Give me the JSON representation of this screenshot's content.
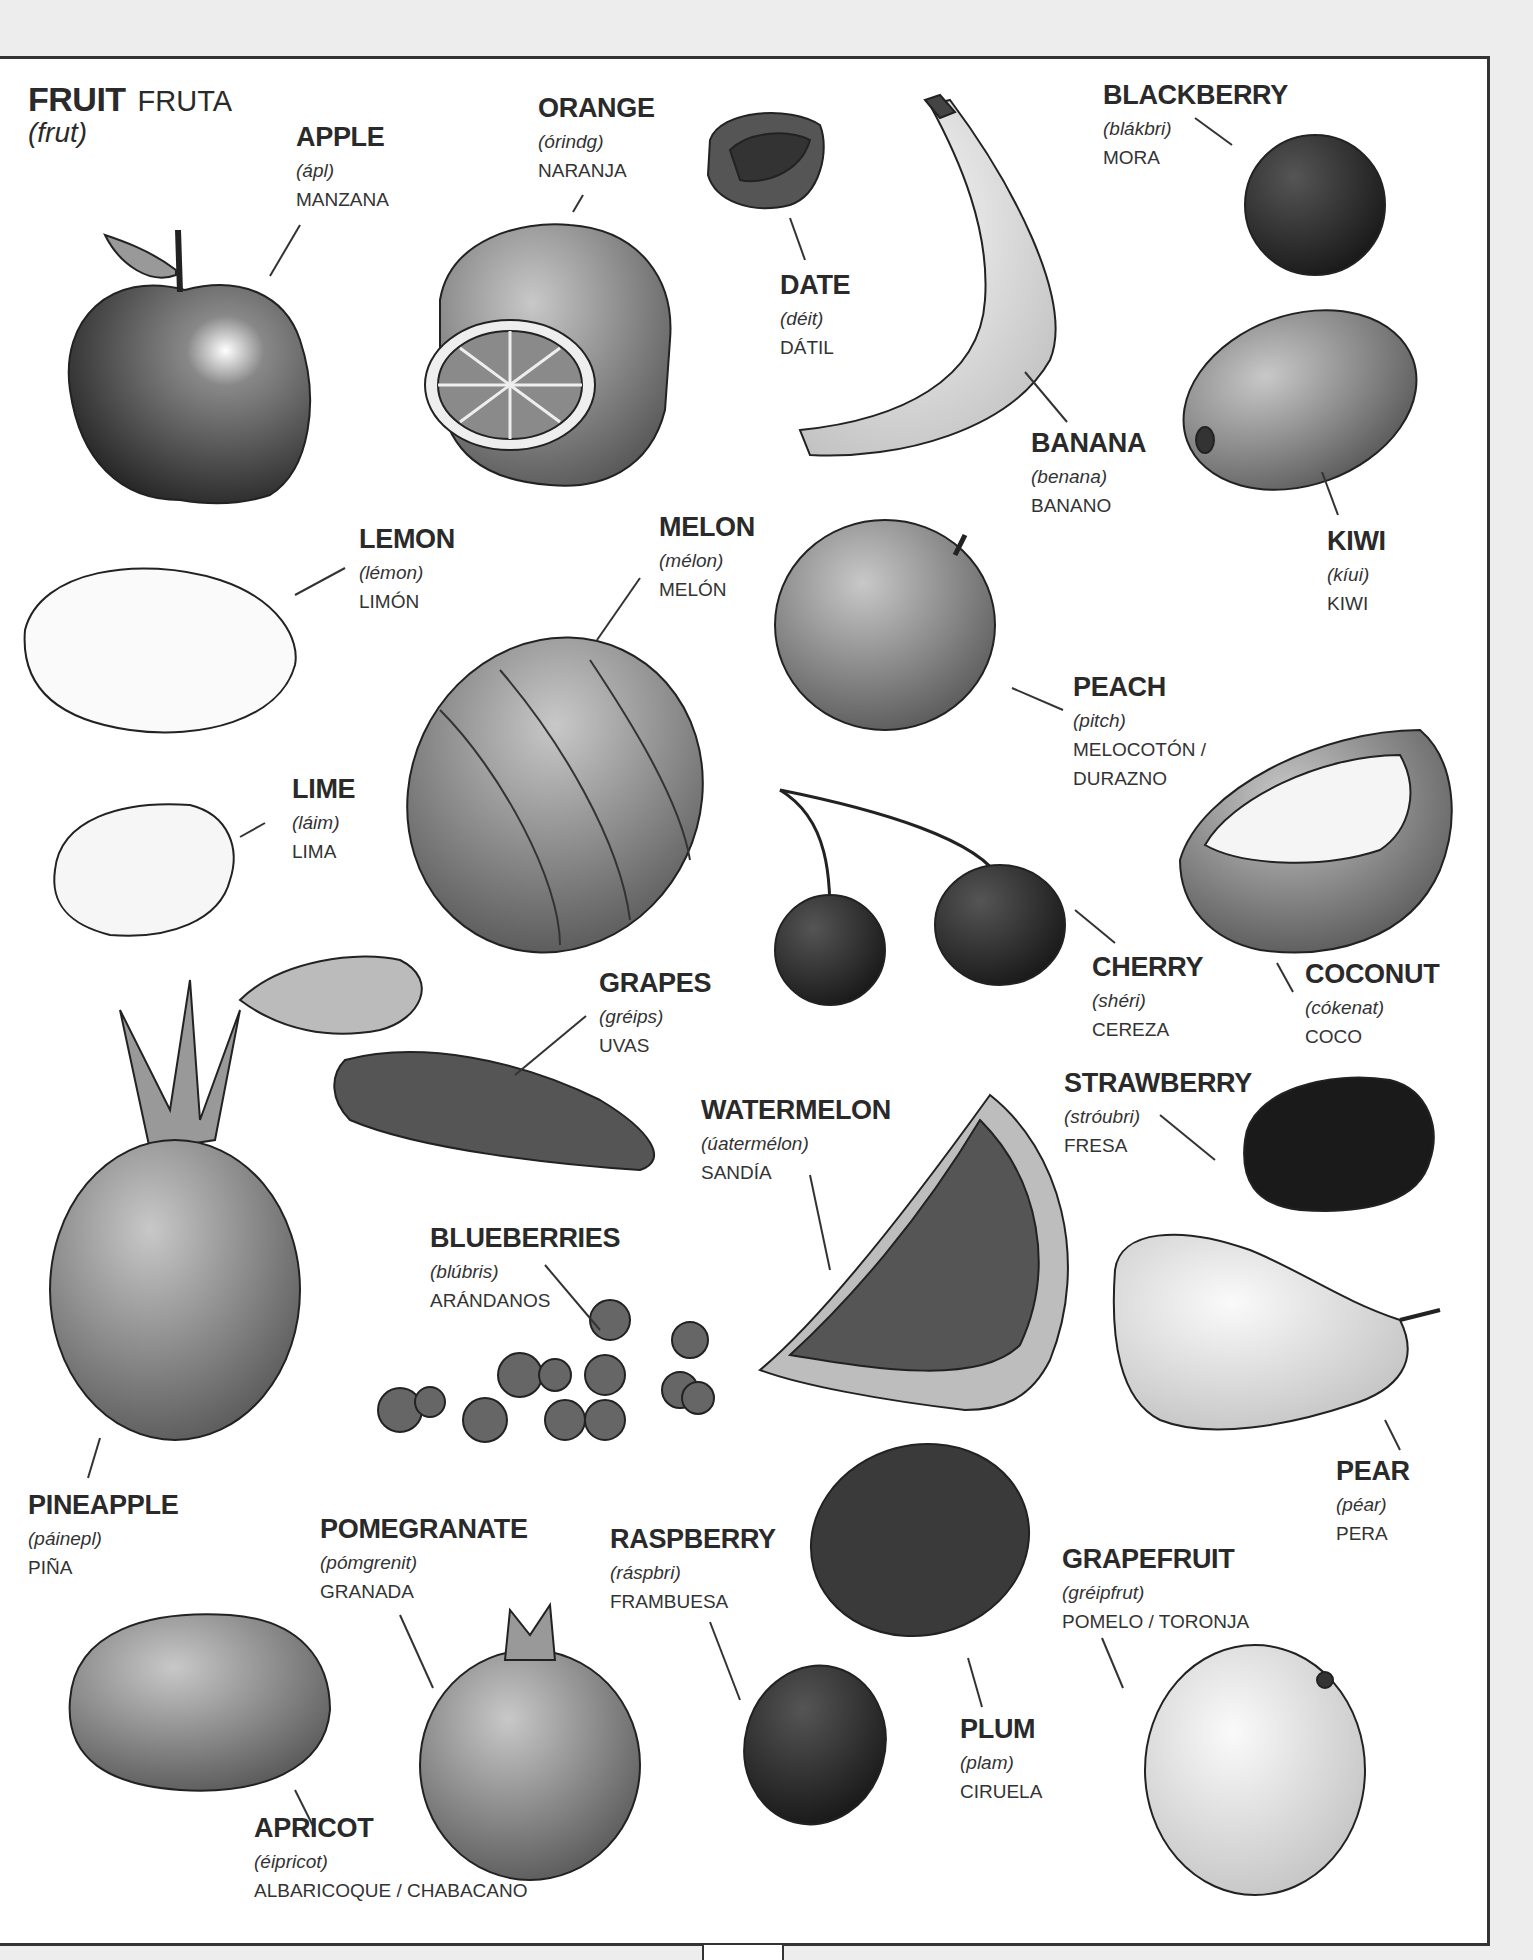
{
  "title": {
    "english": "FRUIT",
    "spanish": "FRUTA",
    "pronunciation": "(frut)"
  },
  "fruits": [
    {
      "id": "apple",
      "english": "APPLE",
      "pronunciation": "(ápl)",
      "spanish": "MANZANA"
    },
    {
      "id": "orange",
      "english": "ORANGE",
      "pronunciation": "(órindg)",
      "spanish": "NARANJA"
    },
    {
      "id": "date",
      "english": "DATE",
      "pronunciation": "(déit)",
      "spanish": "DÁTIL"
    },
    {
      "id": "banana",
      "english": "BANANA",
      "pronunciation": "(benana)",
      "spanish": "BANANO"
    },
    {
      "id": "blackberry",
      "english": "BLACKBERRY",
      "pronunciation": "(blákbri)",
      "spanish": "MORA"
    },
    {
      "id": "kiwi",
      "english": "KIWI",
      "pronunciation": "(kíui)",
      "spanish": "KIWI"
    },
    {
      "id": "lemon",
      "english": "LEMON",
      "pronunciation": "(lémon)",
      "spanish": "LIMÓN"
    },
    {
      "id": "melon",
      "english": "MELON",
      "pronunciation": "(mélon)",
      "spanish": "MELÓN"
    },
    {
      "id": "peach",
      "english": "PEACH",
      "pronunciation": "(pitch)",
      "spanish": "MELOCOTÓN /",
      "spanish_line2": "DURAZNO"
    },
    {
      "id": "lime",
      "english": "LIME",
      "pronunciation": "(láim)",
      "spanish": "LIMA"
    },
    {
      "id": "grapes",
      "english": "GRAPES",
      "pronunciation": "(gréips)",
      "spanish": "UVAS"
    },
    {
      "id": "cherry",
      "english": "CHERRY",
      "pronunciation": "(shéri)",
      "spanish": "CEREZA"
    },
    {
      "id": "coconut",
      "english": "COCONUT",
      "pronunciation": "(cókenat)",
      "spanish": "COCO"
    },
    {
      "id": "strawberry",
      "english": "STRAWBERRY",
      "pronunciation": "(stróubri)",
      "spanish": "FRESA"
    },
    {
      "id": "watermelon",
      "english": "WATERMELON",
      "pronunciation": "(úatermélon)",
      "spanish": "SANDÍA"
    },
    {
      "id": "blueberries",
      "english": "BLUEBERRIES",
      "pronunciation": "(blúbris)",
      "spanish": "ARÁNDANOS"
    },
    {
      "id": "pear",
      "english": "PEAR",
      "pronunciation": "(péar)",
      "spanish": "PERA"
    },
    {
      "id": "pineapple",
      "english": "PINEAPPLE",
      "pronunciation": "(páinepl)",
      "spanish": "PIÑA"
    },
    {
      "id": "pomegranate",
      "english": "POMEGRANATE",
      "pronunciation": "(pómgrenit)",
      "spanish": "GRANADA"
    },
    {
      "id": "raspberry",
      "english": "RASPBERRY",
      "pronunciation": "(ráspbri)",
      "spanish": "FRAMBUESA"
    },
    {
      "id": "grapefruit",
      "english": "GRAPEFRUIT",
      "pronunciation": "(gréipfrut)",
      "spanish": "POMELO / TORONJA"
    },
    {
      "id": "plum",
      "english": "PLUM",
      "pronunciation": "(plam)",
      "spanish": "CIRUELA"
    },
    {
      "id": "apricot",
      "english": "APRICOT",
      "pronunciation": "(éipricot)",
      "spanish": "ALBARICOQUE / CHABACANO"
    }
  ]
}
